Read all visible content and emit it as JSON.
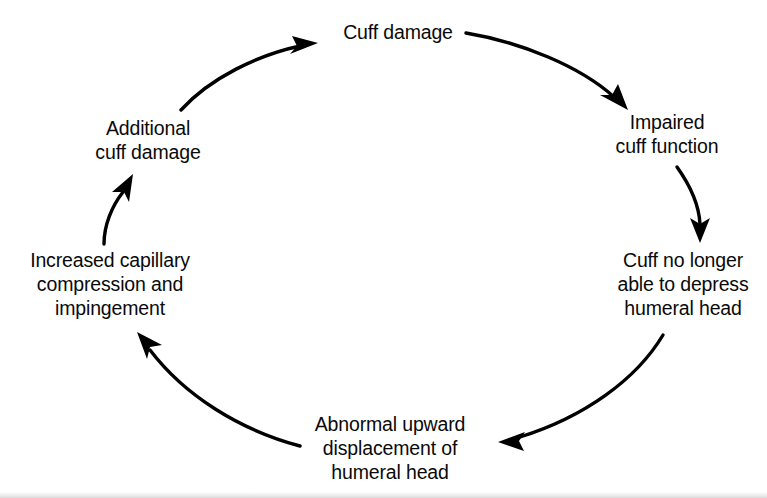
{
  "diagram": {
    "type": "cycle",
    "background_color": "#ffffff",
    "text_color": "#0a0a0a",
    "stroke_color": "#000000",
    "nodes": [
      {
        "id": "cuff-damage",
        "lines": [
          "Cuff damage"
        ]
      },
      {
        "id": "impaired-cuff-function",
        "lines": [
          "Impaired",
          "cuff function"
        ]
      },
      {
        "id": "cuff-no-longer-able",
        "lines": [
          "Cuff no longer",
          "able to depress",
          "humeral head"
        ]
      },
      {
        "id": "abnormal-upward-displacement",
        "lines": [
          "Abnormal upward",
          "displacement of",
          "humeral head"
        ]
      },
      {
        "id": "increased-capillary-compression",
        "lines": [
          "Increased capillary",
          "compression and",
          "impingement"
        ]
      },
      {
        "id": "additional-cuff-damage",
        "lines": [
          "Additional",
          "cuff damage"
        ]
      }
    ],
    "edges": [
      {
        "id": "edge-1",
        "from": "cuff-damage",
        "to": "impaired-cuff-function"
      },
      {
        "id": "edge-2",
        "from": "impaired-cuff-function",
        "to": "cuff-no-longer-able"
      },
      {
        "id": "edge-3",
        "from": "cuff-no-longer-able",
        "to": "abnormal-upward-displacement"
      },
      {
        "id": "edge-4",
        "from": "abnormal-upward-displacement",
        "to": "increased-capillary-compression"
      },
      {
        "id": "edge-5",
        "from": "increased-capillary-compression",
        "to": "additional-cuff-damage"
      },
      {
        "id": "edge-6",
        "from": "additional-cuff-damage",
        "to": "cuff-damage"
      }
    ]
  }
}
